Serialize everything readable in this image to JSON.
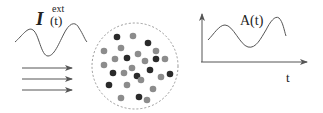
{
  "left_panel": {
    "input_symbol": "I",
    "input_superscript": "ext",
    "input_argument": "(t)",
    "arrow_count": 3
  },
  "center_panel": {
    "circle": {
      "cx": 135,
      "cy": 66,
      "r": 43
    },
    "colors": {
      "dark": "#2a2a2a",
      "gray": "#8c8c8c",
      "outline": "#999999"
    },
    "dots": [
      {
        "x": 117,
        "y": 37,
        "type": "dark"
      },
      {
        "x": 133,
        "y": 36,
        "type": "gray"
      },
      {
        "x": 148,
        "y": 43,
        "type": "dark"
      },
      {
        "x": 104,
        "y": 51,
        "type": "gray"
      },
      {
        "x": 121,
        "y": 48,
        "type": "gray"
      },
      {
        "x": 138,
        "y": 54,
        "type": "gray"
      },
      {
        "x": 156,
        "y": 51,
        "type": "gray"
      },
      {
        "x": 115,
        "y": 59,
        "type": "gray"
      },
      {
        "x": 127,
        "y": 58,
        "type": "dark"
      },
      {
        "x": 145,
        "y": 61,
        "type": "gray"
      },
      {
        "x": 156,
        "y": 59,
        "type": "dark"
      },
      {
        "x": 165,
        "y": 59,
        "type": "gray"
      },
      {
        "x": 104,
        "y": 65,
        "type": "gray"
      },
      {
        "x": 113,
        "y": 73,
        "type": "dark"
      },
      {
        "x": 124,
        "y": 73,
        "type": "gray"
      },
      {
        "x": 132,
        "y": 68,
        "type": "gray"
      },
      {
        "x": 137,
        "y": 76,
        "type": "dark"
      },
      {
        "x": 150,
        "y": 70,
        "type": "dark"
      },
      {
        "x": 141,
        "y": 80,
        "type": "gray"
      },
      {
        "x": 161,
        "y": 77,
        "type": "gray"
      },
      {
        "x": 170,
        "y": 74,
        "type": "dark"
      },
      {
        "x": 109,
        "y": 85,
        "type": "dark"
      },
      {
        "x": 127,
        "y": 85,
        "type": "gray"
      },
      {
        "x": 153,
        "y": 89,
        "type": "gray"
      },
      {
        "x": 121,
        "y": 98,
        "type": "gray"
      },
      {
        "x": 139,
        "y": 97,
        "type": "dark"
      },
      {
        "x": 147,
        "y": 100,
        "type": "gray"
      }
    ]
  },
  "right_panel": {
    "output_label": "A(t)",
    "x_axis_label": "t"
  }
}
